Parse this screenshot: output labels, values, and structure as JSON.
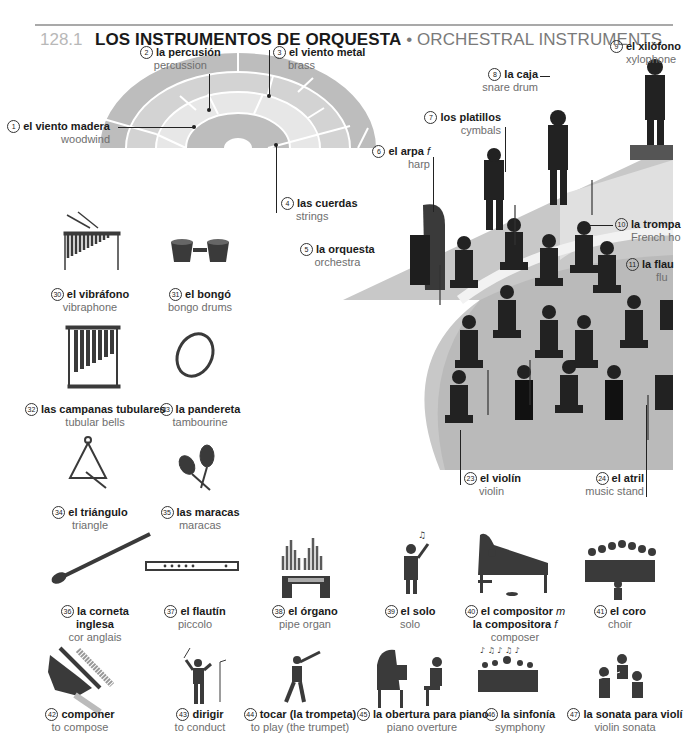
{
  "header": {
    "section_number": "128.1",
    "title_es": "LOS INSTRUMENTOS DE ORQUESTA",
    "separator": " • ",
    "title_en": "ORCHESTRAL INSTRUMENTS"
  },
  "colors": {
    "rule": "#a9a9a9",
    "stage_grey": "#c8c8c8",
    "diagram_dark": "#b9b9b9",
    "diagram_mid": "#d2d2d2",
    "diagram_light": "#e6e6e6",
    "icon_dark": "#3a3a3a"
  },
  "seating_diagram": {
    "sections": [
      {
        "n": "1",
        "es": "el viento madera",
        "en": "woodwind"
      },
      {
        "n": "2",
        "es": "la percusión",
        "en": "percussion"
      },
      {
        "n": "3",
        "es": "el viento metal",
        "en": "brass"
      },
      {
        "n": "4",
        "es": "las cuerdas",
        "en": "strings"
      }
    ]
  },
  "orchestra_scene": {
    "labels": [
      {
        "n": "5",
        "es": "la orquesta",
        "en": "orchestra"
      },
      {
        "n": "6",
        "es": "el arpa",
        "gender": "f",
        "en": "harp"
      },
      {
        "n": "7",
        "es": "los platillos",
        "en": "cymbals"
      },
      {
        "n": "8",
        "es": "la caja",
        "en": "snare drum"
      },
      {
        "n": "9",
        "es": "el xilófono",
        "en": "xylophone"
      },
      {
        "n": "10",
        "es": "la trompa",
        "en": "French ho"
      },
      {
        "n": "11",
        "es": "la flau",
        "en": "flu"
      },
      {
        "n": "23",
        "es": "el violín",
        "en": "violin"
      },
      {
        "n": "24",
        "es": "el atril",
        "en": "music stand"
      }
    ]
  },
  "instruments": [
    {
      "n": "30",
      "es": "el vibráfono",
      "en": "vibraphone"
    },
    {
      "n": "31",
      "es": "el bongó",
      "en": "bongo drums"
    },
    {
      "n": "32",
      "es": "las campanas tubulares",
      "en": "tubular bells"
    },
    {
      "n": "33",
      "es": "la pandereta",
      "en": "tambourine"
    },
    {
      "n": "34",
      "es": "el triángulo",
      "en": "triangle"
    },
    {
      "n": "35",
      "es": "las maracas",
      "en": "maracas"
    },
    {
      "n": "36",
      "es": "la corneta",
      "es2": "inglesa",
      "en": "cor anglais"
    },
    {
      "n": "37",
      "es": "el flautín",
      "en": "piccolo"
    },
    {
      "n": "38",
      "es": "el órgano",
      "en": "pipe organ"
    },
    {
      "n": "39",
      "es": "el solo",
      "en": "solo"
    },
    {
      "n": "40",
      "es": "el compositor",
      "g1": "m",
      "es2": "la compositora",
      "g2": "f",
      "en": "composer"
    },
    {
      "n": "41",
      "es": "el coro",
      "en": "choir"
    },
    {
      "n": "42",
      "es": "componer",
      "en": "to compose"
    },
    {
      "n": "43",
      "es": "dirigir",
      "en": "to conduct"
    },
    {
      "n": "44",
      "es": "tocar (la trompeta)",
      "en": "to play (the trumpet)"
    },
    {
      "n": "45",
      "es": "la obertura para piano",
      "en": "piano overture"
    },
    {
      "n": "46",
      "es": "la sinfonía",
      "en": "symphony"
    },
    {
      "n": "47",
      "es": "la sonata para violí",
      "en": "violin sonata"
    }
  ]
}
